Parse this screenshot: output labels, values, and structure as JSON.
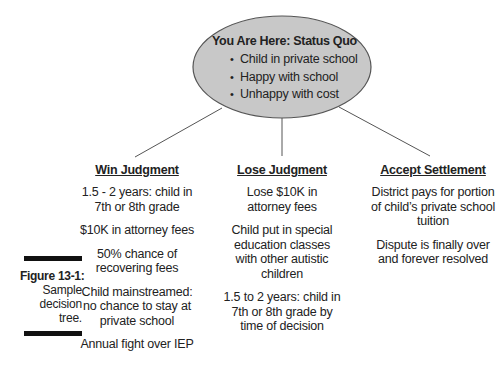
{
  "root": {
    "title": "You Are Here: Status Quo",
    "bullets": [
      "Child in private school",
      "Happy with school",
      "Unhappy with cost"
    ],
    "fill_color": "#c8c8c8",
    "stroke_color": "#555555"
  },
  "branches": [
    {
      "heading": "Win Judgment",
      "items": [
        "1.5 - 2 years: child in 7th or 8th grade",
        "$10K in attorney fees",
        "50% chance of recovering fees",
        "Child mainstreamed: no chance to stay at private school",
        "Annual fight over IEP"
      ]
    },
    {
      "heading": "Lose Judgment",
      "items": [
        "Lose $10K in attorney fees",
        "Child put in special education classes with other autistic children",
        "1.5 to 2 years: child in 7th or 8th grade by time of decision"
      ]
    },
    {
      "heading": "Accept Settlement",
      "items": [
        "District pays for portion of child’s private school tuition",
        "Dispute is finally over and forever resolved"
      ]
    }
  ],
  "caption": {
    "label": "Figure 13-1:",
    "lines": [
      "Sample",
      "decision",
      "tree."
    ]
  }
}
